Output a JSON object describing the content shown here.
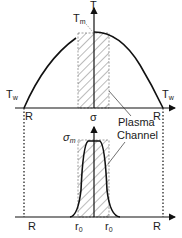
{
  "top_plot": {
    "y_axis_label": "T",
    "peak_label": "T",
    "peak_sub": "m",
    "left_wall_label": "T",
    "left_wall_sub": "w",
    "right_wall_label": "T",
    "right_wall_sub": "w",
    "left_edge_label": "R",
    "right_edge_label": "R"
  },
  "bottom_plot": {
    "y_axis_label": "σ",
    "peak_label": "σ",
    "peak_sub": "m",
    "left_edge_label": "R",
    "right_edge_label": "R",
    "left_radius_label": "r",
    "left_radius_sub": "0",
    "right_radius_label": "r",
    "right_radius_sub": "0"
  },
  "annotation": {
    "line1": "Plasma",
    "line2": "Channel"
  },
  "colors": {
    "line": "#111111",
    "hatch": "#555555",
    "dashed": "#777777"
  }
}
